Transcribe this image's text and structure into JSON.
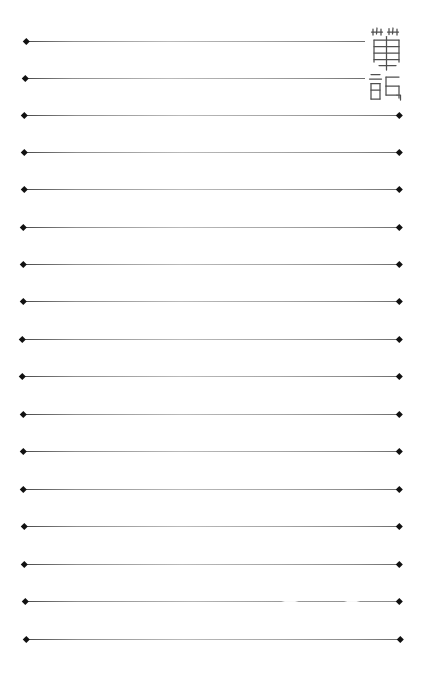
{
  "page": {
    "name": "notebook-writing-paper",
    "width": 421,
    "height": 680,
    "background_color": "#ffffff",
    "line_color": "#8d8d8d",
    "marker_color": "#111111"
  },
  "title": {
    "text": "筆記",
    "characters": [
      "筆",
      "記"
    ],
    "orientation": "vertical",
    "style": "woodblock-seal-script",
    "position": "top-right",
    "color": "#4a4a4a"
  },
  "ruled_lines": {
    "count": 17,
    "spacing": 37.5,
    "short_line_end_x": 365,
    "full_line_end_x": 399,
    "start_x": 24,
    "items": [
      {
        "index": 1,
        "y": 41,
        "x1": 26,
        "x2": 365,
        "cap_start": true,
        "cap_end": false,
        "broken": false
      },
      {
        "index": 2,
        "y": 78,
        "x1": 25,
        "x2": 365,
        "cap_start": true,
        "cap_end": false,
        "broken": false
      },
      {
        "index": 3,
        "y": 115,
        "x1": 24,
        "x2": 399,
        "cap_start": true,
        "cap_end": true,
        "broken": false
      },
      {
        "index": 4,
        "y": 152,
        "x1": 24,
        "x2": 399,
        "cap_start": true,
        "cap_end": true,
        "broken": false
      },
      {
        "index": 5,
        "y": 189,
        "x1": 24,
        "x2": 399,
        "cap_start": true,
        "cap_end": true,
        "broken": false
      },
      {
        "index": 6,
        "y": 227,
        "x1": 23,
        "x2": 399,
        "cap_start": true,
        "cap_end": true,
        "broken": false
      },
      {
        "index": 7,
        "y": 264,
        "x1": 23,
        "x2": 399,
        "cap_start": true,
        "cap_end": true,
        "broken": false
      },
      {
        "index": 8,
        "y": 301,
        "x1": 23,
        "x2": 399,
        "cap_start": true,
        "cap_end": true,
        "broken": false
      },
      {
        "index": 9,
        "y": 339,
        "x1": 22,
        "x2": 399,
        "cap_start": true,
        "cap_end": true,
        "broken": false
      },
      {
        "index": 10,
        "y": 376,
        "x1": 22,
        "x2": 399,
        "cap_start": true,
        "cap_end": true,
        "broken": false
      },
      {
        "index": 11,
        "y": 414,
        "x1": 23,
        "x2": 399,
        "cap_start": true,
        "cap_end": true,
        "broken": false
      },
      {
        "index": 12,
        "y": 451,
        "x1": 23,
        "x2": 399,
        "cap_start": true,
        "cap_end": true,
        "broken": false
      },
      {
        "index": 13,
        "y": 489,
        "x1": 23,
        "x2": 399,
        "cap_start": true,
        "cap_end": true,
        "broken": false
      },
      {
        "index": 14,
        "y": 526,
        "x1": 24,
        "x2": 399,
        "cap_start": true,
        "cap_end": true,
        "broken": false
      },
      {
        "index": 15,
        "y": 564,
        "x1": 24,
        "x2": 399,
        "cap_start": true,
        "cap_end": true,
        "broken": false
      },
      {
        "index": 16,
        "y": 601,
        "x1": 25,
        "x2": 399,
        "cap_start": true,
        "cap_end": true,
        "broken": true
      },
      {
        "index": 17,
        "y": 639,
        "x1": 26,
        "x2": 400,
        "cap_start": true,
        "cap_end": true,
        "broken": false
      }
    ]
  }
}
